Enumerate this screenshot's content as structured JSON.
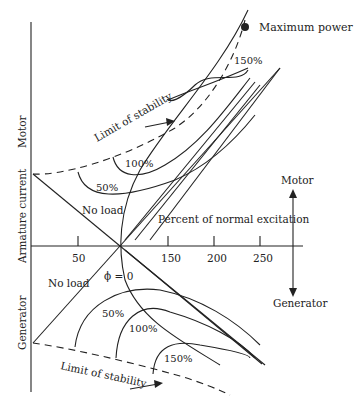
{
  "diagram": {
    "labels": {
      "max_power": "Maximum power",
      "limit_stability_top": "Limit of stability",
      "limit_stability_bottom": "Limit of stability",
      "no_load_top": "No load",
      "no_load_bottom": "No load",
      "phi_zero": "ϕ = 0",
      "x_axis": "Percent of normal excitation",
      "y_axis": "Armature current",
      "motor_vertical": "Motor",
      "generator_vertical": "Generator",
      "motor_right": "Motor",
      "generator_right": "Generator",
      "top_150": "150%",
      "top_100": "100%",
      "top_50": "50%",
      "bot_50": "50%",
      "bot_100": "100%",
      "bot_150": "150%"
    },
    "x_ticks": [
      "50",
      "150",
      "200",
      "250"
    ],
    "colors": {
      "line": "#222222",
      "background": "#ffffff"
    }
  }
}
